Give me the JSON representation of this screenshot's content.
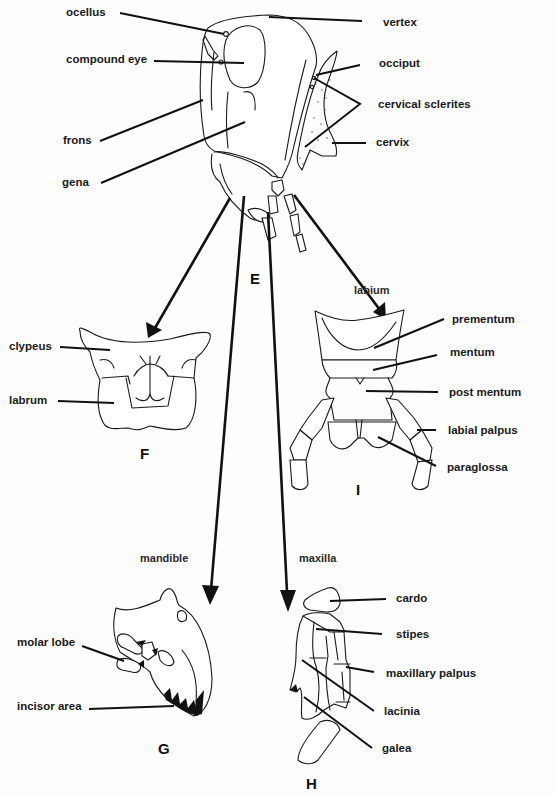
{
  "figure": {
    "views": [
      {
        "id": "E",
        "label": "E",
        "description": "insect head lateral view"
      },
      {
        "id": "F",
        "label": "F",
        "description": "clypeus and labrum"
      },
      {
        "id": "G",
        "label": "G",
        "subtitle": "mandible"
      },
      {
        "id": "H",
        "label": "H",
        "subtitle": "maxilla"
      },
      {
        "id": "I",
        "label": "I",
        "subtitle": "labium"
      }
    ],
    "head_labels": {
      "ocellus": "ocellus",
      "compound_eye": "compound eye",
      "frons": "frons",
      "gena": "gena",
      "vertex": "vertex",
      "occiput": "occiput",
      "cervical_sclerites": "cervical sclerites",
      "cervix": "cervix"
    },
    "labrum_labels": {
      "clypeus": "clypeus",
      "labrum": "labrum"
    },
    "labium_labels": {
      "prementum": "prementum",
      "mentum": "mentum",
      "post_mentum": "post mentum",
      "labial_palpus": "labial palpus",
      "paraglossa": "paraglossa"
    },
    "mandible_labels": {
      "molar_lobe": "molar lobe",
      "incisor_area": "incisor area"
    },
    "maxilla_labels": {
      "cardo": "cardo",
      "stipes": "stipes",
      "maxillary_palpus": "maxillary palpus",
      "lacinia": "lacinia",
      "galea": "galea"
    },
    "colors": {
      "ink": "#1a1a1a",
      "background": "#fdfdfd"
    }
  }
}
